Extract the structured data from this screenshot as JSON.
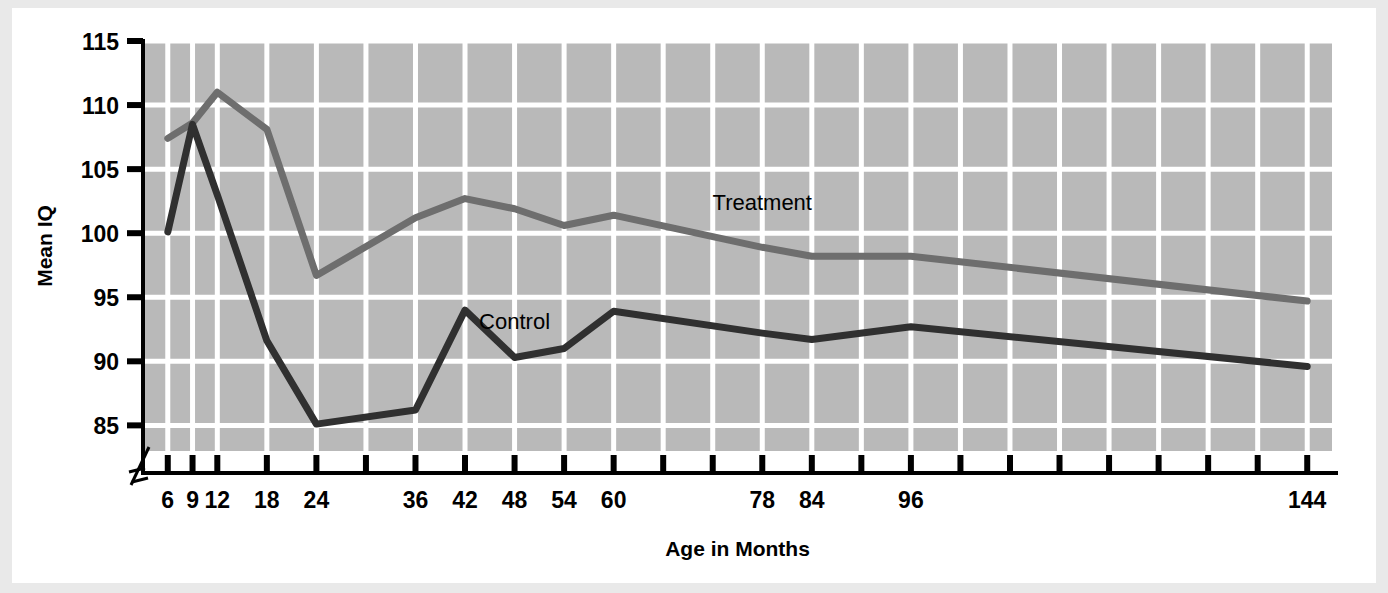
{
  "figure": {
    "background": "#ffffff",
    "page_background": "#e9e9e9",
    "plot_background": "#b9b9b9",
    "gridline_color": "#ffffff",
    "axis_color": "#000000"
  },
  "chart_data": {
    "type": "line",
    "title": "",
    "xlabel": "Age in Months",
    "ylabel": "Mean IQ",
    "ylim": [
      83,
      115
    ],
    "yticks": [
      85,
      90,
      95,
      100,
      105,
      110,
      115
    ],
    "ytick_labels": [
      "85",
      "90",
      "95",
      "100",
      "105",
      "110",
      "115"
    ],
    "xlim": [
      3,
      147
    ],
    "x_axis_break": true,
    "grid": true,
    "grid_axis": "both",
    "legend_position": "inline-labels",
    "x": [
      6,
      9,
      12,
      18,
      24,
      36,
      42,
      48,
      54,
      60,
      78,
      84,
      96,
      144
    ],
    "xtick_values": [
      6,
      9,
      12,
      18,
      24,
      30,
      36,
      42,
      48,
      54,
      60,
      66,
      72,
      78,
      84,
      90,
      96,
      102,
      108,
      114,
      120,
      126,
      132,
      138,
      144
    ],
    "xtick_labels": [
      "6",
      "9",
      "12",
      "18",
      "24",
      "",
      "36",
      "42",
      "48",
      "54",
      "60",
      "",
      "",
      "78",
      "84",
      "",
      "96",
      "",
      "",
      "",
      "",
      "",
      "",
      "",
      "144"
    ],
    "series": [
      {
        "name": "Treatment",
        "color": "#6e6e6e",
        "label_position": {
          "x": 78,
          "y": 101.8
        },
        "values": [
          107.4,
          108.6,
          111.0,
          108.1,
          96.7,
          101.2,
          102.7,
          101.9,
          100.6,
          101.4,
          98.9,
          98.2,
          98.2,
          94.7
        ]
      },
      {
        "name": "Control",
        "color": "#303030",
        "label_position": {
          "x": 48,
          "y": 92.5
        },
        "values": [
          100.1,
          108.5,
          103.0,
          91.6,
          85.1,
          86.2,
          94.0,
          90.3,
          91.0,
          93.9,
          92.2,
          91.7,
          92.7,
          89.6
        ]
      }
    ]
  }
}
